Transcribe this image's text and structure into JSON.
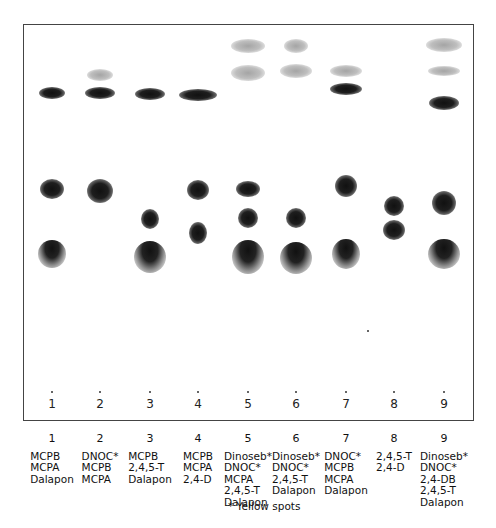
{
  "figure": {
    "footnote": "* Yellow spots"
  },
  "lanes": [
    {
      "number": "1",
      "compounds": [
        "MCPB",
        "MCPA",
        "Dalapon"
      ]
    },
    {
      "number": "2",
      "compounds": [
        "DNOC*",
        "MCPB",
        "MCPA"
      ]
    },
    {
      "number": "3",
      "compounds": [
        "MCPB",
        "2,4,5-T",
        "Dalapon"
      ]
    },
    {
      "number": "4",
      "compounds": [
        "MCPB",
        "MCPA",
        "2,4-D"
      ]
    },
    {
      "number": "5",
      "compounds": [
        "Dinoseb*",
        "DNOC*",
        "MCPA",
        "2,4,5-T",
        "Dalapon"
      ]
    },
    {
      "number": "6",
      "compounds": [
        "Dinoseb*",
        "DNOC*",
        "2,4,5-T",
        "Dalapon"
      ]
    },
    {
      "number": "7",
      "compounds": [
        "DNOC*",
        "MCPB",
        "MCPA",
        "Dalapon"
      ]
    },
    {
      "number": "8",
      "compounds": [
        "2,4,5-T",
        "2,4-D"
      ]
    },
    {
      "number": "9",
      "compounds": [
        "Dinoseb*",
        "DNOC*",
        "2,4-DB",
        "2,4,5-T",
        "Dalapon"
      ]
    }
  ],
  "chart_data": {
    "type": "scatter",
    "xlabel": "Lane",
    "ylabel": "Migration distance (px from origin, approx.)",
    "categories": [
      "1",
      "2",
      "3",
      "4",
      "5",
      "6",
      "7",
      "8",
      "9"
    ],
    "origin_y_px": 392,
    "spots": [
      {
        "lane": 1,
        "y": 93,
        "w": 26,
        "h": 12,
        "style": "dark"
      },
      {
        "lane": 1,
        "y": 189,
        "w": 24,
        "h": 20,
        "style": "dark"
      },
      {
        "lane": 1,
        "y": 254,
        "w": 28,
        "h": 28,
        "style": "tail"
      },
      {
        "lane": 2,
        "y": 75,
        "w": 26,
        "h": 12,
        "style": "faint"
      },
      {
        "lane": 2,
        "y": 93,
        "w": 30,
        "h": 12,
        "style": "dark"
      },
      {
        "lane": 2,
        "y": 191,
        "w": 26,
        "h": 24,
        "style": "dark"
      },
      {
        "lane": 3,
        "y": 94,
        "w": 30,
        "h": 12,
        "style": "dark"
      },
      {
        "lane": 3,
        "y": 219,
        "w": 18,
        "h": 20,
        "style": "dark"
      },
      {
        "lane": 3,
        "y": 257,
        "w": 32,
        "h": 32,
        "style": "tail"
      },
      {
        "lane": 4,
        "y": 95,
        "w": 38,
        "h": 12,
        "style": "dark"
      },
      {
        "lane": 4,
        "y": 190,
        "w": 22,
        "h": 20,
        "style": "dark"
      },
      {
        "lane": 4,
        "y": 233,
        "w": 18,
        "h": 22,
        "style": "dark"
      },
      {
        "lane": 5,
        "y": 46,
        "w": 34,
        "h": 14,
        "style": "faint"
      },
      {
        "lane": 5,
        "y": 73,
        "w": 34,
        "h": 16,
        "style": "faint"
      },
      {
        "lane": 5,
        "y": 189,
        "w": 24,
        "h": 16,
        "style": "dark"
      },
      {
        "lane": 5,
        "y": 218,
        "w": 20,
        "h": 20,
        "style": "dark"
      },
      {
        "lane": 5,
        "y": 257,
        "w": 32,
        "h": 34,
        "style": "tail"
      },
      {
        "lane": 6,
        "y": 46,
        "w": 24,
        "h": 14,
        "style": "faint"
      },
      {
        "lane": 6,
        "y": 71,
        "w": 32,
        "h": 14,
        "style": "faint"
      },
      {
        "lane": 6,
        "y": 218,
        "w": 20,
        "h": 20,
        "style": "dark"
      },
      {
        "lane": 6,
        "y": 258,
        "w": 32,
        "h": 32,
        "style": "tail"
      },
      {
        "lane": 7,
        "y": 71,
        "w": 32,
        "h": 12,
        "style": "faint"
      },
      {
        "lane": 7,
        "y": 89,
        "w": 32,
        "h": 12,
        "style": "dark"
      },
      {
        "lane": 7,
        "y": 186,
        "w": 22,
        "h": 22,
        "style": "dark"
      },
      {
        "lane": 7,
        "y": 254,
        "w": 28,
        "h": 30,
        "style": "tail"
      },
      {
        "lane": 8,
        "y": 206,
        "w": 20,
        "h": 20,
        "style": "dark"
      },
      {
        "lane": 8,
        "y": 230,
        "w": 22,
        "h": 20,
        "style": "dark"
      },
      {
        "lane": 9,
        "y": 45,
        "w": 36,
        "h": 14,
        "style": "faint"
      },
      {
        "lane": 9,
        "y": 71,
        "w": 32,
        "h": 10,
        "style": "faint"
      },
      {
        "lane": 9,
        "y": 103,
        "w": 30,
        "h": 14,
        "style": "dark"
      },
      {
        "lane": 9,
        "y": 203,
        "w": 24,
        "h": 24,
        "style": "dark"
      },
      {
        "lane": 9,
        "y": 254,
        "w": 32,
        "h": 30,
        "style": "tail"
      }
    ],
    "legend": "* Yellow spots",
    "grid": false
  },
  "layout": {
    "lane_x": [
      52,
      100,
      150,
      198,
      248,
      296,
      346,
      394,
      444
    ]
  }
}
